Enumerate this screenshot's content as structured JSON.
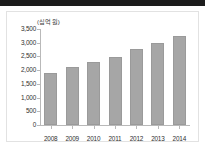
{
  "header": {
    "bar_color": "#1c1c1c"
  },
  "figure": {
    "unit_label": "(십억 원)",
    "border_color": "#e2e2e2",
    "background": "#ffffff"
  },
  "chart_data": {
    "type": "bar",
    "title": "",
    "subtitle": "",
    "xlabel": "",
    "ylabel": "(십억 원)",
    "categories": [
      "2008",
      "2009",
      "2010",
      "2011",
      "2012",
      "2013",
      "2014"
    ],
    "values": [
      1890,
      2120,
      2280,
      2470,
      2780,
      2990,
      3250
    ],
    "series": [
      {
        "name": "",
        "values": [
          1890,
          2120,
          2280,
          2470,
          2780,
          2990,
          3250
        ],
        "color": "#a6a6a6"
      }
    ],
    "ylim": [
      0,
      3500
    ],
    "ytick_values": [
      0,
      500,
      1000,
      1500,
      2000,
      2500,
      3000,
      3500
    ],
    "ytick_labels": [
      "0",
      "500",
      "1,000",
      "1,500",
      "2,000",
      "2,500",
      "3,000",
      "3,500"
    ],
    "grid": false,
    "legend": false,
    "legend_position": "none",
    "bar_color": "#a6a6a6",
    "axis_color": "#b9b9b9"
  }
}
